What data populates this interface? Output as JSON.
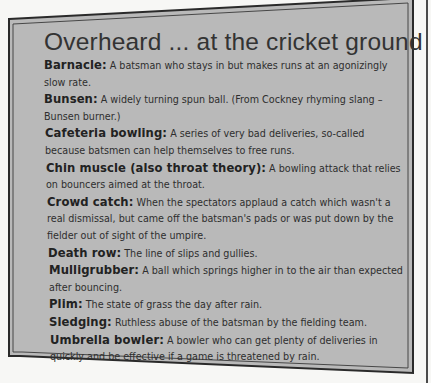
{
  "box": {
    "title": "Overheard ... at the cricket ground",
    "fill_color": "#b9b9b9",
    "border_color": "#2a2a2a"
  },
  "entries": [
    {
      "term": "Barnacle:",
      "definition": " A batsman who stays in but makes runs at an agonizingly slow rate."
    },
    {
      "term": "Bunsen:",
      "definition": " A widely turning spun ball. (From Cockney rhyming slang – Bunsen burner.)"
    },
    {
      "term": "Cafeteria bowling:",
      "definition": " A series of very bad deliveries, so-called because batsmen can help themselves to free runs."
    },
    {
      "term": "Chin muscle (also throat theory):",
      "definition": " A bowling attack that relies on bouncers aimed at the throat."
    },
    {
      "term": "Crowd catch:",
      "definition": " When the spectators applaud a catch which wasn't a real dismissal, but came off the batsman's pads or was put down by the fielder out of sight of the umpire."
    },
    {
      "term": "Death row:",
      "definition": " The line of slips and gullies."
    },
    {
      "term": "Mulligrubber:",
      "definition": " A ball which springs higher in to the air than expected after bouncing."
    },
    {
      "term": "Plim:",
      "definition": " The state of grass the day after rain."
    },
    {
      "term": "Sledging:",
      "definition": " Ruthless abuse of the batsman by the fielding team."
    },
    {
      "term": "Umbrella bowler:",
      "definition": " A bowler who can get plenty of deliveries in quickly and be effective if a game is threatened by rain."
    }
  ]
}
